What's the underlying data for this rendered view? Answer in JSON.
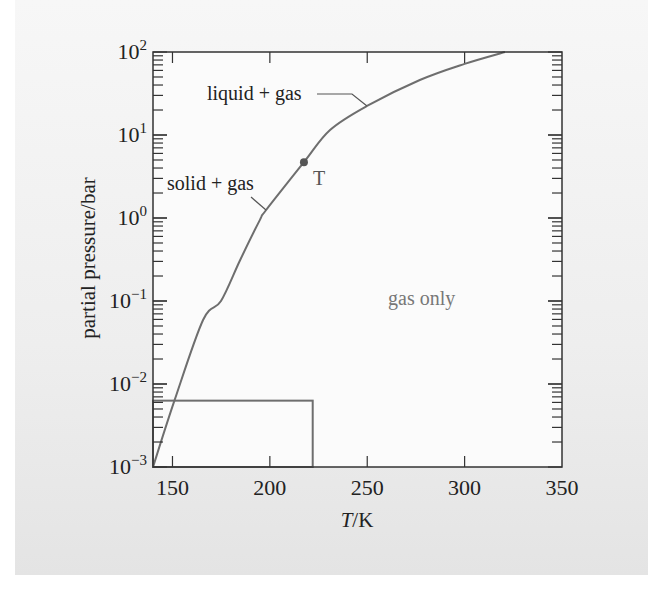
{
  "chart_data": {
    "type": "line",
    "title": "",
    "xlabel": "T/K",
    "xlabel_italic_part": "T",
    "xlabel_rest": "/K",
    "ylabel": "partial pressure/bar",
    "xlim": [
      140,
      350
    ],
    "ylim": [
      0.001,
      100
    ],
    "yscale": "log",
    "x_ticks": [
      150,
      200,
      250,
      300,
      350
    ],
    "x_tick_labels": [
      "150",
      "200",
      "250",
      "300",
      "350"
    ],
    "y_ticks": [
      0.001,
      0.01,
      0.1,
      1,
      10,
      100
    ],
    "y_tick_labels": [
      {
        "base": "10",
        "exp": "−3"
      },
      {
        "base": "10",
        "exp": "−2"
      },
      {
        "base": "10",
        "exp": "−1"
      },
      {
        "base": "10",
        "exp": "0"
      },
      {
        "base": "10",
        "exp": "1"
      },
      {
        "base": "10",
        "exp": "2"
      }
    ],
    "grid": false,
    "series": [
      {
        "name": "coexistence curve",
        "color": "#6e6e6e",
        "x": [
          140,
          151,
          165.7,
          174.9,
          184.7,
          194.9,
          198,
          217.5,
          230.9,
          249.9,
          277,
          300,
          320.7
        ],
        "y": [
          0.001,
          0.0063,
          0.059,
          0.1,
          0.31,
          0.95,
          1.24,
          4.7,
          11.5,
          22.4,
          46,
          72,
          100
        ]
      }
    ],
    "triple_point": {
      "label": "T",
      "x": 217.5,
      "y": 4.7
    },
    "rectangle": {
      "x0": 140,
      "x1": 222,
      "y0": 0.001,
      "y1": 0.0063,
      "color": "#6e6e6e"
    },
    "annotations": [
      {
        "id": "liquid-gas",
        "text": "liquid + gas"
      },
      {
        "id": "solid-gas",
        "text": "solid + gas"
      },
      {
        "id": "gas-only",
        "text": "gas only"
      }
    ],
    "legend": "none"
  },
  "colors": {
    "axis": "#333333",
    "curve": "#6e6e6e",
    "gas_only_text": "#777777",
    "plot_bg": "#fbfbfb"
  }
}
